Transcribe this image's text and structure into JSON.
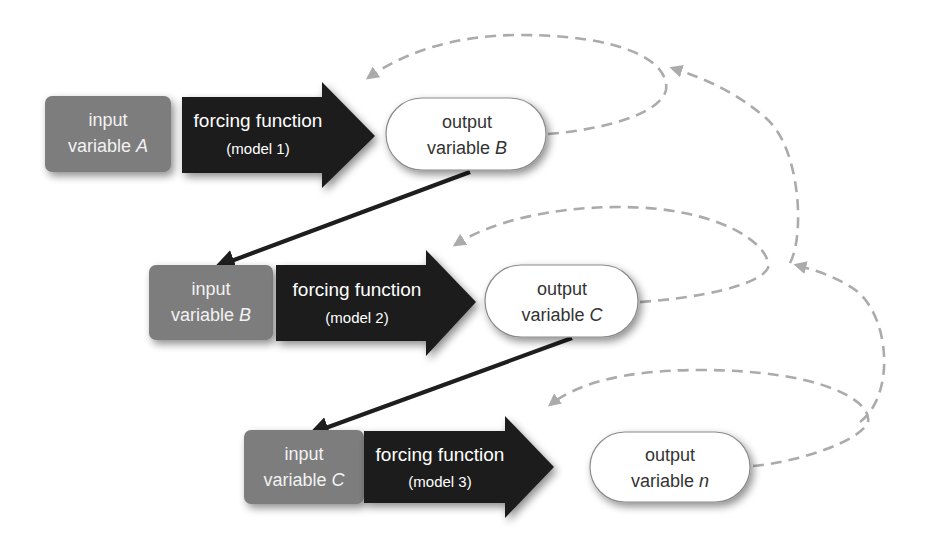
{
  "diagram": {
    "title": "",
    "stages": [
      {
        "input": {
          "line1": "input",
          "line2_prefix": "variable ",
          "variable": "A"
        },
        "function": {
          "line1": "forcing function",
          "line2": "(model 1)"
        },
        "output": {
          "line1": "output",
          "line2_prefix": "variable ",
          "variable": "B"
        }
      },
      {
        "input": {
          "line1": "input",
          "line2_prefix": "variable ",
          "variable": "B"
        },
        "function": {
          "line1": "forcing function",
          "line2": "(model 2)"
        },
        "output": {
          "line1": "output",
          "line2_prefix": "variable ",
          "variable": "C"
        }
      },
      {
        "input": {
          "line1": "input",
          "line2_prefix": "variable ",
          "variable": "C"
        },
        "function": {
          "line1": "forcing function",
          "line2": "(model 3)"
        },
        "output": {
          "line1": "output",
          "line2_prefix": "variable ",
          "variable": "n"
        }
      }
    ],
    "edges": [
      {
        "from": "output variable B",
        "to": "input variable B",
        "style": "solid-arrow"
      },
      {
        "from": "output variable C",
        "to": "input variable C",
        "style": "solid-arrow"
      },
      {
        "from": "output variable B",
        "to": "forcing function (model 1)",
        "style": "dashed-feedback"
      },
      {
        "from": "output variable C",
        "to": "forcing function (model 2)",
        "style": "dashed-feedback"
      },
      {
        "from": "output variable n",
        "to": "forcing function (model 3)",
        "style": "dashed-feedback"
      },
      {
        "from": "output variable C",
        "to": "feedback loop 1",
        "style": "dashed-feedback"
      },
      {
        "from": "output variable n",
        "to": "feedback loop 2",
        "style": "dashed-feedback"
      }
    ],
    "colors": {
      "input_fill": "#7d7d7d",
      "function_fill": "#1e1e1e",
      "output_fill": "#ffffff",
      "output_stroke": "#8a8a8a",
      "link_stroke": "#1e1e1e",
      "feedback_stroke": "#ababab"
    }
  }
}
